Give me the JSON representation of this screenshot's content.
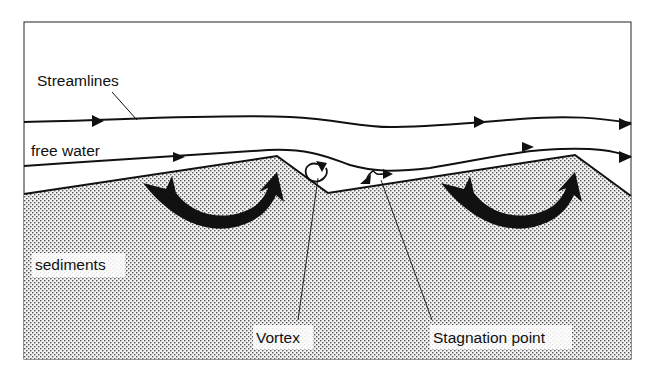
{
  "diagram": {
    "type": "schematic",
    "labels": {
      "streamlines": "Streamlines",
      "free_water": "free water",
      "sediments": "sediments",
      "vortex": "Vortex",
      "stagnation_point": "Stagnation point"
    },
    "colors": {
      "line": "#111111",
      "background": "#ffffff",
      "sediment_dots": "#555555",
      "sediment_base": "#f2f2f2"
    },
    "elements": [
      {
        "name": "streamline-upper",
        "kind": "flow line with arrows",
        "arrows": 3
      },
      {
        "name": "streamline-lower",
        "kind": "flow line with arrows",
        "arrows": 3
      },
      {
        "name": "sediment-bed",
        "kind": "stippled region with two ripple crests"
      },
      {
        "name": "circulation-arrow-left",
        "kind": "curved black arrow"
      },
      {
        "name": "circulation-arrow-right",
        "kind": "curved black arrow"
      },
      {
        "name": "vortex-symbol",
        "kind": "small circular arrow in trough"
      },
      {
        "name": "stagnation-symbol",
        "kind": "diverging double arrow"
      }
    ]
  }
}
